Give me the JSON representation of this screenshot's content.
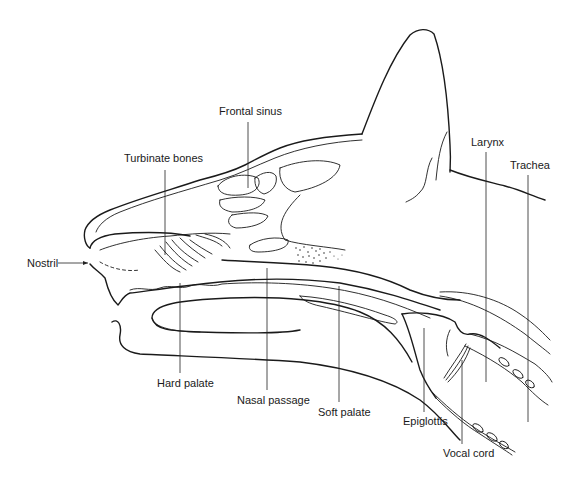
{
  "figure": {
    "background": "#ffffff",
    "ink_color": "#1a1a1a"
  },
  "labels": {
    "frontal_sinus": "Frontal sinus",
    "turbinate_bones": "Turbinate bones",
    "nostril": "Nostril",
    "larynx": "Larynx",
    "trachea": "Trachea",
    "hard_palate": "Hard palate",
    "nasal_passage": "Nasal passage",
    "soft_palate": "Soft palate",
    "epiglottis": "Epiglottis",
    "vocal_cord": "Vocal cord"
  }
}
